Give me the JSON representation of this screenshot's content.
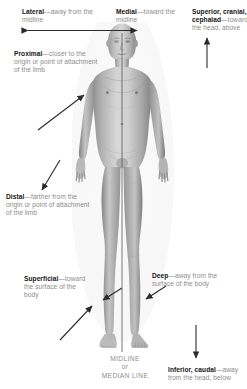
{
  "colors": {
    "term": "#161616",
    "definition": "#8c8c8c",
    "arrow": "#2b2b2b",
    "midline": "#555555",
    "background": "#ffffff"
  },
  "figure": {
    "name": "anterior-human-body-grayscale"
  },
  "midline": {
    "label_line1": "MIDLINE",
    "label_line2": "or",
    "label_line3": "MEDIAN LINE"
  },
  "callouts": [
    {
      "id": "lateral",
      "term": "Lateral",
      "separator": "—",
      "definition": "away from the midline",
      "arrow": "double-headed-horizontal"
    },
    {
      "id": "medial",
      "term": "Medial",
      "separator": "—",
      "definition": "toward the midline",
      "arrow": "double-headed-horizontal"
    },
    {
      "id": "superior",
      "term": "Superior, cranial, cephalad",
      "separator": "—",
      "definition": "toward the head, above",
      "arrow": "up"
    },
    {
      "id": "proximal",
      "term": "Proximal",
      "separator": "—",
      "definition": "closer to the origin or point of attachment of the limb",
      "arrow": "diagonal-up-right"
    },
    {
      "id": "distal",
      "term": "Distal",
      "separator": "—",
      "definition": "farther from the origin or point of attachment of the limb",
      "arrow": "diagonal-down-right"
    },
    {
      "id": "superficial",
      "term": "Superficial",
      "separator": "—",
      "definition": "toward the surface of the body",
      "arrow": "diagonal-up-right-short"
    },
    {
      "id": "deep",
      "term": "Deep",
      "separator": "—",
      "definition": "away from the surface of the body",
      "arrow": "diagonal-left-short"
    },
    {
      "id": "inferior",
      "term": "Inferior, caudal",
      "separator": "—",
      "definition": "away from the head, below",
      "arrow": "down"
    }
  ]
}
